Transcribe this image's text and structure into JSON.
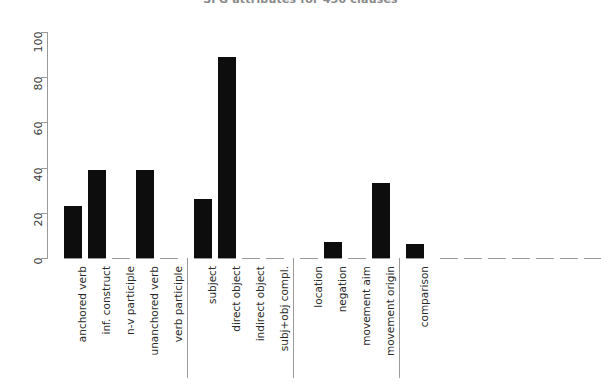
{
  "chart_data": {
    "type": "bar",
    "title": "SFG attributes for 450 clauses",
    "xlabel": "",
    "ylabel": "",
    "ylim": [
      0,
      100
    ],
    "yticks": [
      0,
      20,
      40,
      60,
      80,
      100
    ],
    "grid": false,
    "legend": null,
    "orientation": "vertical",
    "bar_color": "#0d0d0d",
    "axis_color": "#9a9a9a",
    "groups": [
      {
        "name": "process / verb type",
        "categories": [
          "anchored verb",
          "inf. construct",
          "n-v participle",
          "unanchored verb",
          "verb participle"
        ],
        "values": [
          23,
          39,
          0,
          39,
          0
        ]
      },
      {
        "name": "participants",
        "categories": [
          "subject",
          "direct object",
          "indirect object",
          "subj+obj compl."
        ],
        "values": [
          26,
          89,
          0,
          0
        ]
      },
      {
        "name": "circumstances",
        "categories": [
          "location",
          "negation",
          "movement aim",
          "movement origin"
        ],
        "values": [
          0,
          7,
          0,
          33
        ]
      },
      {
        "name": "other",
        "categories": [
          "comparison"
        ],
        "values": [
          6
        ]
      }
    ],
    "unlabeled_empty_slots": 7,
    "categories": [
      "anchored verb",
      "inf. construct",
      "n-v participle",
      "unanchored verb",
      "verb participle",
      "subject",
      "direct object",
      "indirect object",
      "subj+obj compl.",
      "location",
      "negation",
      "movement aim",
      "movement origin",
      "comparison"
    ],
    "values": [
      23,
      39,
      0,
      39,
      0,
      26,
      89,
      0,
      0,
      0,
      7,
      0,
      33,
      6
    ]
  }
}
